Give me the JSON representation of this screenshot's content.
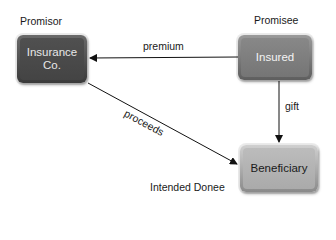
{
  "diagram": {
    "nodes": [
      {
        "id": "insurance",
        "label_line1": "Insurance",
        "label_line2": "Co.",
        "role": "Promisor",
        "fill": "#4a4a4a"
      },
      {
        "id": "insured",
        "label": "Insured",
        "role": "Promisee",
        "fill": "#7a7a7a"
      },
      {
        "id": "beneficiary",
        "label": "Beneficiary",
        "role": "Intended Donee",
        "fill": "#b0b0b0"
      }
    ],
    "edges": [
      {
        "from": "insured",
        "to": "insurance",
        "label": "premium"
      },
      {
        "from": "insured",
        "to": "beneficiary",
        "label": "gift"
      },
      {
        "from": "insurance",
        "to": "beneficiary",
        "label": "proceeds"
      }
    ]
  }
}
